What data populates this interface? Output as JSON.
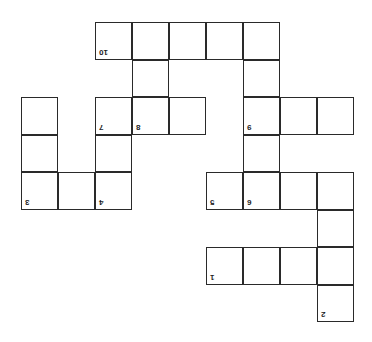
{
  "puzzle": {
    "type": "crossword-grid",
    "orientation": "rotated-180",
    "origin": {
      "x": 22,
      "y": 23
    },
    "cell_w": 37,
    "cell_h": 37.5,
    "line_color": "#2a2a2a",
    "cells": [
      {
        "r": 0,
        "c": 2,
        "n": "10"
      },
      {
        "r": 0,
        "c": 3
      },
      {
        "r": 0,
        "c": 4
      },
      {
        "r": 0,
        "c": 5
      },
      {
        "r": 0,
        "c": 6
      },
      {
        "r": 1,
        "c": 3
      },
      {
        "r": 1,
        "c": 6
      },
      {
        "r": 2,
        "c": 0
      },
      {
        "r": 2,
        "c": 2,
        "n": "7"
      },
      {
        "r": 2,
        "c": 3,
        "n": "8"
      },
      {
        "r": 2,
        "c": 4
      },
      {
        "r": 2,
        "c": 6,
        "n": "9"
      },
      {
        "r": 2,
        "c": 7
      },
      {
        "r": 2,
        "c": 8
      },
      {
        "r": 3,
        "c": 0
      },
      {
        "r": 3,
        "c": 2
      },
      {
        "r": 3,
        "c": 6
      },
      {
        "r": 4,
        "c": 0,
        "n": "3"
      },
      {
        "r": 4,
        "c": 1
      },
      {
        "r": 4,
        "c": 2,
        "n": "4"
      },
      {
        "r": 4,
        "c": 5,
        "n": "5"
      },
      {
        "r": 4,
        "c": 6,
        "n": "6"
      },
      {
        "r": 4,
        "c": 7
      },
      {
        "r": 4,
        "c": 8
      },
      {
        "r": 5,
        "c": 8
      },
      {
        "r": 6,
        "c": 5,
        "n": "1"
      },
      {
        "r": 6,
        "c": 6
      },
      {
        "r": 6,
        "c": 7
      },
      {
        "r": 6,
        "c": 8
      },
      {
        "r": 7,
        "c": 8,
        "n": "2"
      }
    ]
  }
}
